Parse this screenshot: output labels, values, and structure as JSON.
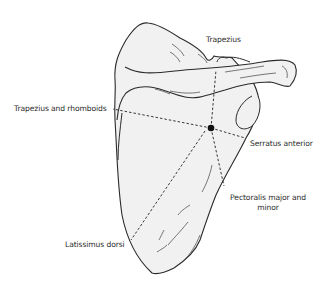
{
  "figure": {
    "colors": {
      "bone_fill": "#f1f1f1",
      "outline": "#2a2a2a",
      "dashed_line": "#222222",
      "text": "#2b2b2b",
      "background": "#ffffff"
    },
    "labels": {
      "trapezius": "Trapezius",
      "trapezius_rhomboids": "Trapezius and rhomboids",
      "serratus_anterior": "Serratus anterior",
      "pectoralis_line1": "Pectoralis major and",
      "pectoralis_line2": "minor",
      "latissimus_dorsi": "Latissimus dorsi"
    },
    "center_point": {
      "x": 211,
      "y": 128
    }
  }
}
